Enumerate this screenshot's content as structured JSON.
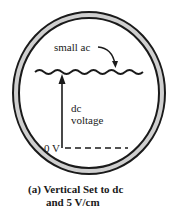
{
  "diagram": {
    "type": "oscilloscope-screen",
    "labels": {
      "small_ac": "small ac",
      "dc": "dc",
      "voltage": "voltage",
      "zero_volts": "0 V"
    },
    "caption": {
      "line1": "(a) Vertical Set to dc",
      "line2": "and 5 V/cm"
    },
    "colors": {
      "ink": "#1a1a1a",
      "bezel_fill": "#c8c8c8",
      "background": "#ffffff"
    }
  }
}
